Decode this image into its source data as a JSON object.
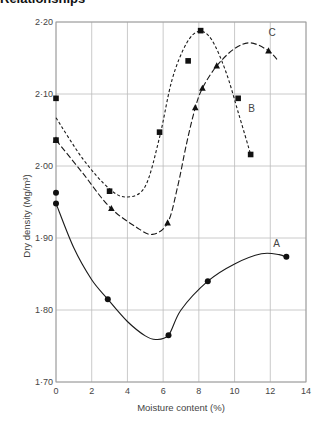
{
  "heading_stub": "Relationships",
  "chart_data": {
    "type": "line",
    "title": "",
    "xlabel": "Moisture content (%)",
    "ylabel": "Dry density (Mg/m³)",
    "xlim": [
      0,
      14
    ],
    "ylim": [
      1.7,
      2.2
    ],
    "x_ticks": [
      0,
      2,
      4,
      6,
      8,
      10,
      12,
      14
    ],
    "x_tick_labels": [
      "0",
      "2",
      "4",
      "6",
      "8",
      "10",
      "12",
      "14"
    ],
    "y_ticks": [
      1.7,
      1.8,
      1.9,
      2.0,
      2.1,
      2.2
    ],
    "y_tick_labels": [
      "1·70",
      "1·80",
      "1·90",
      "2·00",
      "2·10",
      "2·20"
    ],
    "grid": true,
    "legend": "inline curve labels",
    "series": [
      {
        "name": "A",
        "marker": "circle",
        "line_style": "solid",
        "points": [
          [
            0.0,
            1.963
          ],
          [
            0.0,
            1.948
          ],
          [
            2.9,
            1.815
          ],
          [
            6.3,
            1.765
          ],
          [
            8.5,
            1.84
          ],
          [
            12.9,
            1.874
          ]
        ],
        "curve": [
          [
            0.0,
            1.948
          ],
          [
            1.0,
            1.886
          ],
          [
            2.0,
            1.842
          ],
          [
            2.9,
            1.815
          ],
          [
            4.0,
            1.784
          ],
          [
            5.0,
            1.764
          ],
          [
            5.6,
            1.759
          ],
          [
            6.3,
            1.765
          ],
          [
            7.0,
            1.8
          ],
          [
            8.5,
            1.84
          ],
          [
            10.0,
            1.864
          ],
          [
            11.5,
            1.878
          ],
          [
            12.5,
            1.877
          ],
          [
            12.9,
            1.873
          ]
        ],
        "label_pos": [
          12.35,
          1.887
        ]
      },
      {
        "name": "B",
        "marker": "square",
        "line_style": "short-dash",
        "points": [
          [
            0.0,
            2.094
          ],
          [
            0.0,
            2.036
          ],
          [
            3.0,
            1.965
          ],
          [
            5.8,
            2.047
          ],
          [
            7.4,
            2.146
          ],
          [
            8.1,
            2.188
          ],
          [
            10.2,
            2.094
          ],
          [
            10.9,
            2.016
          ]
        ],
        "curve": [
          [
            0.0,
            2.067
          ],
          [
            1.5,
            2.01
          ],
          [
            3.0,
            1.968
          ],
          [
            4.0,
            1.957
          ],
          [
            5.0,
            1.972
          ],
          [
            5.8,
            2.04
          ],
          [
            6.5,
            2.12
          ],
          [
            7.3,
            2.17
          ],
          [
            8.0,
            2.187
          ],
          [
            8.7,
            2.176
          ],
          [
            9.5,
            2.132
          ],
          [
            10.2,
            2.075
          ],
          [
            10.9,
            2.016
          ]
        ],
        "label_pos": [
          10.95,
          2.075
        ]
      },
      {
        "name": "C",
        "marker": "triangle",
        "line_style": "long-dash",
        "points": [
          [
            0.0,
            2.036
          ],
          [
            3.1,
            1.941
          ],
          [
            6.25,
            1.921
          ],
          [
            7.8,
            2.081
          ],
          [
            8.2,
            2.108
          ],
          [
            9.0,
            2.139
          ],
          [
            11.9,
            2.16
          ]
        ],
        "curve": [
          [
            0.0,
            2.036
          ],
          [
            1.5,
            1.99
          ],
          [
            3.0,
            1.943
          ],
          [
            4.5,
            1.915
          ],
          [
            5.4,
            1.905
          ],
          [
            6.25,
            1.921
          ],
          [
            6.8,
            1.97
          ],
          [
            7.3,
            2.03
          ],
          [
            7.8,
            2.081
          ],
          [
            8.2,
            2.108
          ],
          [
            9.0,
            2.139
          ],
          [
            10.0,
            2.163
          ],
          [
            10.9,
            2.171
          ],
          [
            11.9,
            2.16
          ],
          [
            12.45,
            2.146
          ]
        ],
        "label_pos": [
          12.1,
          2.18
        ]
      }
    ]
  }
}
